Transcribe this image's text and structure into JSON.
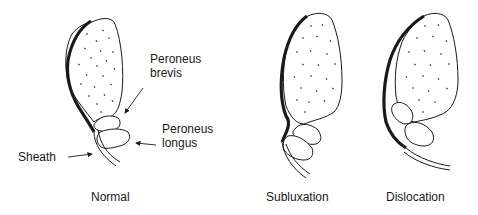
{
  "panels": [
    {
      "id": "normal",
      "caption": "Normal",
      "labels": {
        "peroneus_brevis_line1": "Peroneus",
        "peroneus_brevis_line2": "brevis",
        "peroneus_longus_line1": "Peroneus",
        "peroneus_longus_line2": "longus",
        "sheath": "Sheath"
      }
    },
    {
      "id": "subluxation",
      "caption": "Subluxation"
    },
    {
      "id": "dislocation",
      "caption": "Dislocation"
    }
  ],
  "colors": {
    "stroke": "#1a1a1a",
    "background": "#ffffff"
  }
}
